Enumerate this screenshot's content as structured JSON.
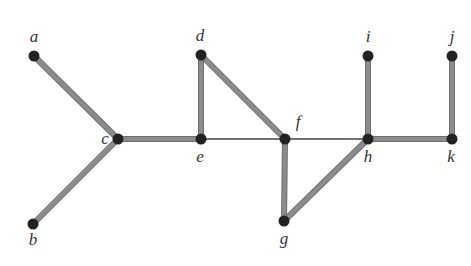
{
  "diagram": {
    "type": "undirected-graph",
    "colors": {
      "background": "#ffffff",
      "node_fill": "#222222",
      "thick_edge": "#8c8c8c",
      "thick_edge_outline": "#6e6e6e",
      "thin_edge": "#444444",
      "label": "#333333"
    },
    "node_radius": 5.5,
    "nodes": [
      {
        "id": "a",
        "label": "a",
        "x": 34,
        "y": 56,
        "lx": 34,
        "ly": 42
      },
      {
        "id": "b",
        "label": "b",
        "x": 33,
        "y": 224,
        "lx": 33,
        "ly": 245
      },
      {
        "id": "c",
        "label": "c",
        "x": 118,
        "y": 139,
        "lx": 105,
        "ly": 144
      },
      {
        "id": "d",
        "label": "d",
        "x": 201,
        "y": 55,
        "lx": 200,
        "ly": 41
      },
      {
        "id": "e",
        "label": "e",
        "x": 201,
        "y": 139,
        "lx": 200,
        "ly": 162
      },
      {
        "id": "f",
        "label": "f",
        "x": 285,
        "y": 139,
        "lx": 298,
        "ly": 127
      },
      {
        "id": "g",
        "label": "g",
        "x": 284,
        "y": 221,
        "lx": 284,
        "ly": 244
      },
      {
        "id": "h",
        "label": "h",
        "x": 368,
        "y": 139,
        "lx": 368,
        "ly": 162
      },
      {
        "id": "i",
        "label": "i",
        "x": 368,
        "y": 56,
        "lx": 368,
        "ly": 42
      },
      {
        "id": "j",
        "label": "j",
        "x": 452,
        "y": 56,
        "lx": 452,
        "ly": 42
      },
      {
        "id": "k",
        "label": "k",
        "x": 452,
        "y": 139,
        "lx": 451,
        "ly": 162
      }
    ],
    "edges": [
      {
        "from": "a",
        "to": "c",
        "style": "thick"
      },
      {
        "from": "b",
        "to": "c",
        "style": "thick"
      },
      {
        "from": "c",
        "to": "e",
        "style": "thick"
      },
      {
        "from": "d",
        "to": "e",
        "style": "thick"
      },
      {
        "from": "d",
        "to": "f",
        "style": "thick"
      },
      {
        "from": "e",
        "to": "f",
        "style": "thin"
      },
      {
        "from": "f",
        "to": "g",
        "style": "thick"
      },
      {
        "from": "g",
        "to": "h",
        "style": "thick"
      },
      {
        "from": "f",
        "to": "h",
        "style": "thin"
      },
      {
        "from": "h",
        "to": "i",
        "style": "thick"
      },
      {
        "from": "h",
        "to": "k",
        "style": "thick"
      },
      {
        "from": "j",
        "to": "k",
        "style": "thick"
      }
    ]
  }
}
